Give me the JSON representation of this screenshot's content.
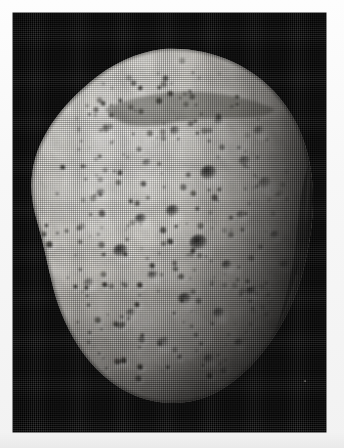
{
  "page": {
    "width": 344,
    "height": 448,
    "background_color": "#fcfcfc",
    "margin_color": "#f7f7f7"
  },
  "photo": {
    "name": "cratered-body-photograph",
    "plate": {
      "x": 13,
      "y": 13,
      "width": 313,
      "height": 419,
      "background_color": "#020202",
      "description": "black space background field"
    },
    "render_style": "halftone-print-scan",
    "colors": {
      "space_black": "#020202",
      "terrain_bright": "#f2efe9",
      "terrain_mid": "#b9b5ae",
      "terrain_shadow": "#4a4742",
      "crater_dark": "#262421",
      "limb_shadow": "#0c0c0c",
      "paper_white": "#fdfdfd"
    },
    "subject": {
      "type": "irregular cratered body",
      "silhouette_note": "rounded-polygonal, widest upper-middle, tapering toward lower-left chin",
      "illumination": "lit from upper-left, terminator along right limb",
      "bounds_in_plate": {
        "left": 18,
        "top": 36,
        "right": 300,
        "bottom": 390
      }
    },
    "features": {
      "crater_count_visible": 0,
      "craters": [
        {
          "cx": 196,
          "cy": 160,
          "r": 11,
          "depth": 0.88
        },
        {
          "cx": 232,
          "cy": 148,
          "r": 8,
          "depth": 0.55
        },
        {
          "cx": 252,
          "cy": 170,
          "r": 9,
          "depth": 0.45
        },
        {
          "cx": 186,
          "cy": 230,
          "r": 12,
          "depth": 0.92
        },
        {
          "cx": 214,
          "cy": 252,
          "r": 7,
          "depth": 0.7
        },
        {
          "cx": 160,
          "cy": 198,
          "r": 9,
          "depth": 0.8
        },
        {
          "cx": 128,
          "cy": 206,
          "r": 8,
          "depth": 0.75
        },
        {
          "cx": 108,
          "cy": 238,
          "r": 10,
          "depth": 0.82
        },
        {
          "cx": 140,
          "cy": 262,
          "r": 7,
          "depth": 0.68
        },
        {
          "cx": 172,
          "cy": 286,
          "r": 9,
          "depth": 0.78
        },
        {
          "cx": 206,
          "cy": 300,
          "r": 8,
          "depth": 0.6
        },
        {
          "cx": 238,
          "cy": 278,
          "r": 7,
          "depth": 0.72
        },
        {
          "cx": 118,
          "cy": 300,
          "r": 6,
          "depth": 0.62
        },
        {
          "cx": 150,
          "cy": 330,
          "r": 8,
          "depth": 0.58
        },
        {
          "cx": 196,
          "cy": 346,
          "r": 7,
          "depth": 0.5
        },
        {
          "cx": 226,
          "cy": 330,
          "r": 6,
          "depth": 0.55
        },
        {
          "cx": 162,
          "cy": 118,
          "r": 7,
          "depth": 0.6
        },
        {
          "cx": 206,
          "cy": 108,
          "r": 6,
          "depth": 0.66
        },
        {
          "cx": 246,
          "cy": 118,
          "r": 7,
          "depth": 0.52
        },
        {
          "cx": 88,
          "cy": 180,
          "r": 6,
          "depth": 0.58
        },
        {
          "cx": 76,
          "cy": 270,
          "r": 7,
          "depth": 0.48
        },
        {
          "cx": 262,
          "cy": 222,
          "r": 6,
          "depth": 0.5
        },
        {
          "cx": 272,
          "cy": 252,
          "r": 6,
          "depth": 0.44
        },
        {
          "cx": 134,
          "cy": 150,
          "r": 6,
          "depth": 0.5
        },
        {
          "cx": 228,
          "cy": 202,
          "r": 6,
          "depth": 0.55
        }
      ]
    }
  }
}
